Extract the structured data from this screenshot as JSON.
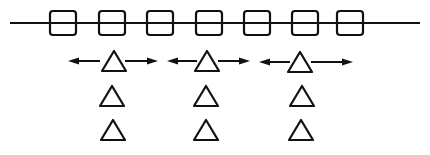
{
  "diagram": {
    "colors": {
      "ink": "#111111",
      "background": "#ffffff"
    },
    "main_line": {
      "x1": 10,
      "x2": 420,
      "y": 23
    },
    "squares": {
      "count": 7,
      "width": 26,
      "height": 24,
      "y": 11,
      "centers_x": [
        63,
        112,
        160,
        209,
        257,
        305,
        350
      ]
    },
    "moving_triangles": [
      {
        "cx": 114,
        "cy": 61,
        "arrow_left": [
          68,
          100
        ],
        "arrow_right": [
          125,
          158
        ]
      },
      {
        "cx": 207,
        "cy": 61,
        "arrow_left": [
          167,
          197
        ],
        "arrow_right": [
          218,
          250
        ]
      },
      {
        "cx": 300,
        "cy": 62,
        "arrow_left": [
          259,
          290
        ],
        "arrow_right": [
          311,
          353
        ]
      }
    ],
    "static_triangle_rows": [
      {
        "cy": 96,
        "centers_x": [
          112,
          206,
          302
        ]
      },
      {
        "cy": 130,
        "centers_x": [
          113,
          206,
          301
        ]
      }
    ],
    "triangle_size": {
      "width": 24,
      "height": 20
    }
  }
}
